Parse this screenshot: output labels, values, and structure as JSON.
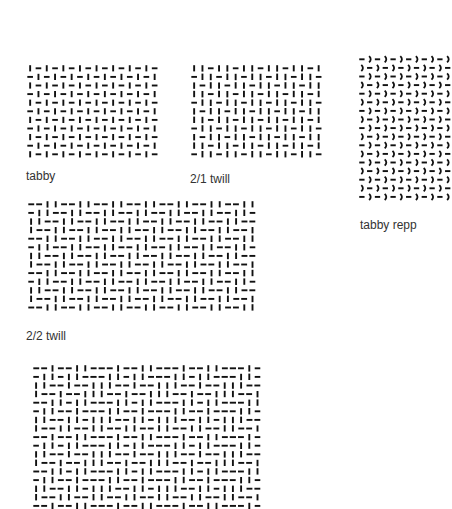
{
  "colors": {
    "ink": "#111111",
    "label": "#333333",
    "background": "#ffffff"
  },
  "panels": [
    {
      "id": "tabby",
      "label": "tabby",
      "x": 26,
      "y": 64,
      "cols": 16,
      "rows": 11,
      "cell_w": 8.3,
      "cell_h": 8.6,
      "repeat": [
        [
          1,
          0
        ],
        [
          0,
          1
        ]
      ],
      "shape": "straight",
      "label_x": 26,
      "label_y": 169
    },
    {
      "id": "twill-2-1",
      "label": "2/1 twill",
      "x": 190,
      "y": 64,
      "cols": 16,
      "rows": 11,
      "cell_w": 8.3,
      "cell_h": 8.6,
      "repeat": [
        [
          1,
          1,
          0
        ],
        [
          0,
          1,
          1
        ],
        [
          1,
          0,
          1
        ]
      ],
      "shape": "straight",
      "label_x": 190,
      "label_y": 172
    },
    {
      "id": "tabby-repp",
      "label": "tabby repp",
      "x": 358,
      "y": 55,
      "cols": 12,
      "rows": 17,
      "cell_w": 7.8,
      "cell_h": 8.6,
      "repeat": [
        [
          0,
          1
        ],
        [
          1,
          0
        ]
      ],
      "shape": "curved",
      "label_x": 360,
      "label_y": 218
    },
    {
      "id": "twill-2-2",
      "label": "2/2 twill",
      "x": 27,
      "y": 200,
      "cols": 28,
      "rows": 13,
      "cell_w": 8.2,
      "cell_h": 8.6,
      "repeat": [
        [
          0,
          0,
          1,
          1
        ],
        [
          0,
          1,
          1,
          0
        ],
        [
          1,
          1,
          0,
          0
        ],
        [
          1,
          0,
          0,
          1
        ]
      ],
      "shape": "straight",
      "label_x": 26,
      "label_y": 329
    },
    {
      "id": "bottom-weave",
      "label": "",
      "x": 32,
      "y": 364,
      "cols": 28,
      "rows": 17,
      "cell_w": 8.2,
      "cell_h": 8.6,
      "repeat": [
        [
          0,
          0,
          1,
          0,
          0,
          1,
          1,
          0
        ],
        [
          0,
          1,
          1,
          0,
          1,
          1,
          0,
          0
        ],
        [
          1,
          1,
          0,
          0,
          1,
          0,
          0,
          1
        ],
        [
          1,
          0,
          0,
          1,
          0,
          0,
          1,
          1
        ],
        [
          0,
          0,
          1,
          1,
          0,
          1,
          1,
          0
        ],
        [
          0,
          1,
          1,
          0,
          0,
          1,
          0,
          0
        ],
        [
          1,
          1,
          0,
          0,
          1,
          1,
          0,
          1
        ],
        [
          1,
          0,
          0,
          1,
          1,
          0,
          0,
          1
        ]
      ],
      "shape": "straight",
      "label_x": 0,
      "label_y": 0
    }
  ]
}
